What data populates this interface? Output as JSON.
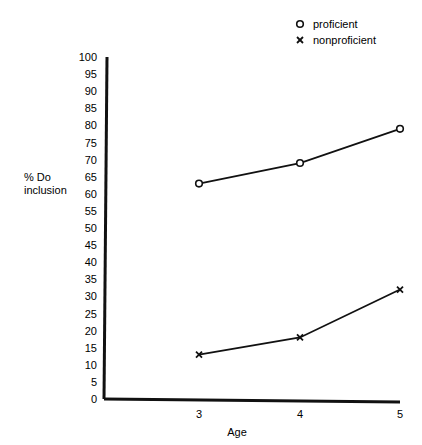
{
  "chart_data": {
    "type": "line",
    "title": "",
    "xlabel": "Age",
    "ylabel": "% Do inclusion",
    "ylabel_lines": [
      "% Do",
      "inclusion"
    ],
    "x": [
      3,
      4,
      5
    ],
    "categories": [
      "3",
      "4",
      "5"
    ],
    "ylim": [
      0,
      100
    ],
    "yticks": [
      0,
      5,
      10,
      15,
      20,
      25,
      30,
      35,
      40,
      45,
      50,
      55,
      60,
      65,
      70,
      75,
      80,
      85,
      90,
      95,
      100
    ],
    "grid": false,
    "legend_position": "top-right",
    "series": [
      {
        "name": "proficient",
        "marker": "o",
        "values": [
          63,
          69,
          79
        ]
      },
      {
        "name": "nonproficient",
        "marker": "x",
        "values": [
          13,
          18,
          32
        ]
      }
    ]
  },
  "legend": {
    "items": [
      {
        "symbol": "O",
        "label": "proficient"
      },
      {
        "symbol": "X",
        "label": "nonproficient"
      }
    ]
  },
  "axis": {
    "x_label": "Age",
    "y_label_line1": "% Do",
    "y_label_line2": "inclusion"
  }
}
